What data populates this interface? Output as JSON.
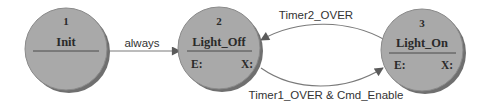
{
  "diagram": {
    "type": "state-machine",
    "colors": {
      "background": "#ffffff",
      "state_fill": "#a9a9a9",
      "state_shadow": "#6f6f6f",
      "state_border": "#8a8a8a",
      "divider": "#4a4a4a",
      "text": "#2a2a2a",
      "edge": "#7a7a7a",
      "arrowhead": "#5a5a5a"
    },
    "states": [
      {
        "id": "1",
        "number": "1",
        "name": "Init",
        "entry_label": "",
        "exit_label": ""
      },
      {
        "id": "2",
        "number": "2",
        "name": "Light_Off",
        "entry_label": "E:",
        "exit_label": "X:"
      },
      {
        "id": "3",
        "number": "3",
        "name": "Light_On",
        "entry_label": "E:",
        "exit_label": "X:"
      }
    ],
    "transitions": [
      {
        "from": "1",
        "to": "2",
        "label": "always"
      },
      {
        "from": "3",
        "to": "2",
        "label": "Timer2_OVER"
      },
      {
        "from": "2",
        "to": "3",
        "label": "Timer1_OVER & Cmd_Enable"
      }
    ]
  }
}
